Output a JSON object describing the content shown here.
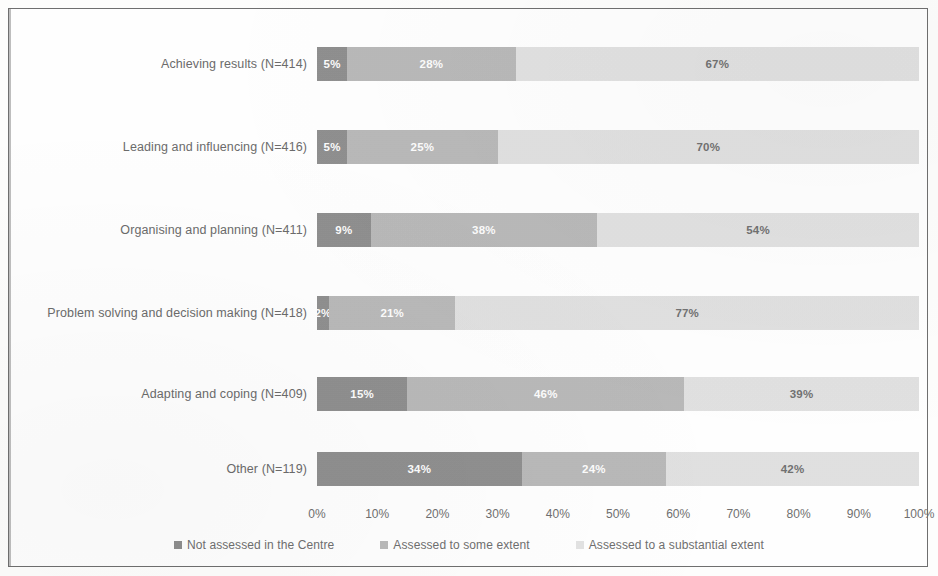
{
  "chart_data": {
    "type": "bar",
    "orientation": "horizontal",
    "stacked": true,
    "normalized": "100%",
    "title": "",
    "xlabel": "",
    "ylabel": "",
    "xlim": [
      0,
      100
    ],
    "grid": false,
    "legend_position": "bottom",
    "categories": [
      "Achieving results (N=414)",
      "Leading and influencing (N=416)",
      "Organising and planning (N=411)",
      "Problem solving and decision making (N=418)",
      "Adapting and coping (N=409)",
      "Other (N=119)"
    ],
    "series": [
      {
        "name": "Not assessed in the Centre",
        "color": "#8e8e8e",
        "values": [
          5,
          5,
          9,
          2,
          15,
          34
        ],
        "labels": [
          "5%",
          "5%",
          "9%",
          "2%",
          "15%",
          "34%"
        ]
      },
      {
        "name": "Assessed to some extent",
        "color": "#b9b9b9",
        "values": [
          28,
          25,
          38,
          21,
          46,
          24
        ],
        "labels": [
          "28%",
          "25%",
          "38%",
          "21%",
          "46%",
          "24%"
        ]
      },
      {
        "name": "Assessed to a substantial extent",
        "color": "#e2e2e2",
        "values": [
          67,
          70,
          54,
          77,
          39,
          42
        ],
        "labels": [
          "67%",
          "70%",
          "54%",
          "77%",
          "39%",
          "42%"
        ]
      }
    ],
    "xticks": [
      "0%",
      "10%",
      "20%",
      "30%",
      "40%",
      "50%",
      "60%",
      "70%",
      "80%",
      "90%",
      "100%"
    ]
  },
  "legend": {
    "items": [
      {
        "label": "Not assessed in the Centre",
        "color": "#8e8e8e"
      },
      {
        "label": "Assessed to some extent",
        "color": "#b9b9b9"
      },
      {
        "label": "Assessed to a substantial extent",
        "color": "#e2e2e2"
      }
    ]
  }
}
